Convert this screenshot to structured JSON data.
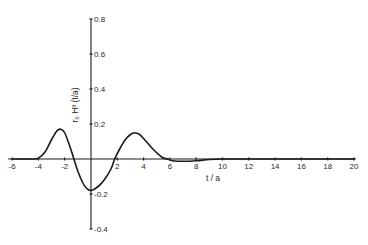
{
  "chart_data": {
    "type": "line",
    "title": "",
    "xlabel": "t / a",
    "ylabel": "r₀ H³ (t/a)",
    "xlim": [
      -6,
      20
    ],
    "ylim": [
      -0.4,
      0.8
    ],
    "grid": false,
    "legend": null,
    "x_ticks": [
      -6,
      -4,
      -2,
      2,
      4,
      6,
      8,
      10,
      12,
      14,
      16,
      18,
      20
    ],
    "x_tick_labels": [
      "-6",
      "-4",
      "-2",
      "2",
      "4",
      "6",
      "8",
      "10",
      "12",
      "14",
      "16",
      "18",
      "20"
    ],
    "y_ticks": [
      0.8,
      0.6,
      0.4,
      0.2,
      -0.2,
      -0.4
    ],
    "y_tick_labels": [
      "0.8",
      "0.6",
      "0.4",
      "0.2",
      "-0.2",
      "-0.4"
    ],
    "series": [
      {
        "name": "r0 H3 (t/a)",
        "x": [
          -6,
          -4.5,
          -4,
          -3.5,
          -3,
          -2.6,
          -2.3,
          -2,
          -1.6,
          -1.3,
          -1,
          -0.6,
          -0.3,
          0,
          0.5,
          1,
          1.5,
          1.8,
          2.2,
          2.6,
          3,
          3.3,
          3.7,
          4.2,
          4.8,
          5.4,
          5.8,
          6.2,
          7,
          8,
          9,
          10,
          12,
          20
        ],
        "y": [
          0,
          0,
          0.005,
          0.04,
          0.11,
          0.16,
          0.17,
          0.15,
          0.07,
          0.0,
          -0.07,
          -0.14,
          -0.17,
          -0.18,
          -0.16,
          -0.12,
          -0.06,
          0.0,
          0.06,
          0.11,
          0.14,
          0.15,
          0.14,
          0.1,
          0.05,
          0.01,
          0.0,
          -0.01,
          -0.013,
          -0.01,
          -0.003,
          0,
          0,
          0
        ]
      }
    ]
  }
}
